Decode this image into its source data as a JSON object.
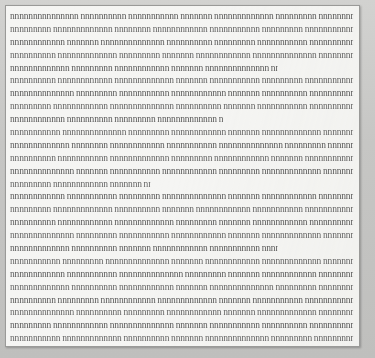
{
  "document": {
    "kind": "scanned-text-page",
    "page_background_color": "#f5f5f3",
    "page_border_color": "#9a9a98",
    "canvas_background_color": "#c9c9c7",
    "ink_color": "#3c3c3c",
    "legibility": "illegible",
    "line_count": 26,
    "line_pitch_px": 12.9,
    "char_pitch_px": 3.3,
    "alignment": "justified",
    "columns": 1,
    "lines": [
      {
        "id": 1,
        "ragged": "",
        "text": "nnnnnnnnnnnnnnn nnnnnnnnnn nnnnnnnnnnn nnnnnnn nnnnnnnnnnnnn nnnnnnnnn nnnnnnnnnnnn nnnnnnnnnnn nnnnnnn nnnnnnnnnnnnnn nnnnnnnnnn nnnnnnnnnnnn nnnnnnnn nnnnnnnnnnn nnnnnnnnnnnnnn nnnnnnnn"
      },
      {
        "id": 2,
        "ragged": "",
        "text": "nnnnnnnnn nnnnnnnnnnnnn nnnnnnnn nnnnnnnnnnnn nnnnnnnnnnn nnnnnnnnn nnnnnnnnnnnnnn nnnnnnn nnnnnnnnnnn nnnnnnnnnnnn nnnnnnnnn nnnnnnnnnnnnn nnnnnnnnnn nnnnnnn nnnnnnnnnnnnnn nnnnnnnnnn"
      },
      {
        "id": 3,
        "ragged": "",
        "text": "nnnnnnnnnnnn nnnnnnn nnnnnnnnnnnnnn nnnnnnnnnn nnnnnnnnn nnnnnnnnnnn nnnnnnnnnnnnn nnnnnnnn nnnnnnnnnnnn nnnnnnnnn nnnnnnnnnnnnnn nnnnnnnnn nnnnnnnnnnn nnnnnnn nnnnnnnnnnnn"
      },
      {
        "id": 4,
        "ragged": "",
        "text": "nnnnnnnnnn nnnnnnnnnnnnn nnnnnnnnn nnnnnnn nnnnnnnnnnnn nnnnnnnnnnnnnn nnnnnnnnnn nnnnnnnnn nnnnnnnnnnn nnnnnnnnnnnn nnnnnnn nnnnnnnnnnnnn nnnnnnnnnn nnnnnnnnnnnn nnnnnnnnn"
      },
      {
        "id": 5,
        "ragged": "short2",
        "text": "nnnnnnnnnnnnn nnnnnnnnn nnnnnnnnnnnn nnnnnnn nnnnnnnnnnnnnn nnnnnnnnnn nnnnnnnnnnn nnnnnnnnn nnnnnnnnnnnn nnnnnnnnnnnn nnnnnn"
      },
      {
        "id": 6,
        "ragged": "",
        "text": "nnnnnnnnnn nnnnnnnnnnnn nnnnnnnnnnnnn nnnnnnn nnnnnnnnnnn nnnnnnnnn nnnnnnnnnnnnnn nnnnnnnnnn nnnnnnnnnnnn nnnnnnnnn nnnnnnn nnnnnnnnnnnnn nnnnnnnnnnn nnnnnnnnnn nnnnnnnnnnnn"
      },
      {
        "id": 7,
        "ragged": "",
        "text": "nnnnnnnnnnnnnn nnnnnnnnn nnnnnnnnnnn nnnnnnnnnnnn nnnnnnn nnnnnnnnnn nnnnnnnnnnnnn nnnnnnnnn nnnnnnnnnnnn nnnnnnnnnnn nnnnnnnnnn nnnnnnn nnnnnnnnnnnnnn nnnnnnnnn nnnnnnnnnnn"
      },
      {
        "id": 8,
        "ragged": "",
        "text": "nnnnnnnnn nnnnnnnnnnnn nnnnnnnnnnnnnn nnnnnnnnnn nnnnnnn nnnnnnnnnnn nnnnnnnnnnnn nnnnnnnnn nnnnnnnnnnnnn nnnnnnnn nnnnnnnnnnnn nnnnnnnnnnn nnnnnnnnnn nnnnnnnnnnnnnn nnnnnnn"
      },
      {
        "id": 9,
        "ragged": "short",
        "text": "nnnnnnnnnnnn nnnnnnnnnn nnnnnnnnn nnnnnnnnnnnnn nnnnnnn nnnnnnnnnnnn nnnnnnnnnnn nnnnnnnn nnnnnnnnn"
      },
      {
        "id": 10,
        "ragged": "",
        "text": "nnnnnnnnnnn nnnnnnnnnnnnnn nnnnnnnnn nnnnnnnnnnnn nnnnnnn nnnnnnnnnnnnn nnnnnnnnnn nnnnnnnnnnnn nnnnnnnnn nnnnnnnnnnn nnnnnnnnnnnnnn nnnnnnn nnnnnnnnnn nnnnnnnnnnnn nnnnnnnnn"
      },
      {
        "id": 11,
        "ragged": "",
        "text": "nnnnnnnnnnnnn nnnnnnnn nnnnnnnnnnnn nnnnnnnnnnn nnnnnnnnnnnnnn nnnnnnnnn nnnnnnn nnnnnnnnnnnn nnnnnnnnnn nnnnnnnnnnnnn nnnnnnnnn nnnnnnnnnnn nnnnnnnnnnnn nnnnnnn nnnnnnnnnnnnnn"
      },
      {
        "id": 12,
        "ragged": "",
        "text": "nnnnnnnnnn nnnnnnnnnnn nnnnnnnnnnnnn nnnnnnnnn nnnnnnnnnnnn nnnnnnn nnnnnnnnnnnnnn nnnnnnnnnn nnnnnnnnn nnnnnnnnnnnn nnnnnnnnnnn nnnnnnnnnnnnn nnnnnnnn nnnnnnnnnnnn nnnnnnnnnn"
      },
      {
        "id": 13,
        "ragged": "",
        "text": "nnnnnnnnnnnnnn nnnnnnn nnnnnnnnnnn nnnnnnnnnnnn nnnnnnnnn nnnnnnnnnnnnn nnnnnnnnnn nnnnnnnnnnnn nnnnnnn nnnnnnnnnnnnnn nnnnnnnnn nnnnnnnnnnn nnnnnnnnnn nnnnnnnnnnnn nnnnnnnnnnnnn"
      },
      {
        "id": 14,
        "ragged": "short3",
        "text": "nnnnnnnnn nnnnnnnnnnnn nnnnnnn nnnnnnnnnnnnnn nnnnnnnnnn nnnnnnnnn"
      },
      {
        "id": 15,
        "ragged": "",
        "text": "nnnnnnnnnnnn nnnnnnnnnnn nnnnnnnnn nnnnnnnnnnnnnn nnnnnnn nnnnnnnnnnnn nnnnnnnnnnnnn nnnnnnnnnn nnnnnnnnn nnnnnnnnnnn nnnnnnnnnnnn nnnnnnn nnnnnnnnnnnnnn nnnnnnnnnn nnnnnnnnnnnn"
      },
      {
        "id": 16,
        "ragged": "",
        "text": "nnnnnnnnn nnnnnnnnnnnnn nnnnnnnnnn nnnnnnn nnnnnnnnnnnn nnnnnnnnnnn nnnnnnnnnnnnnn nnnnnnnnn nnnnnnnnnnnn nnnnnnnnnn nnnnnnn nnnnnnnnnnnnn nnnnnnnnnnn nnnnnnnnn nnnnnnnnnnnnnn"
      },
      {
        "id": 17,
        "ragged": "",
        "text": "nnnnnnnnnn nnnnnnnnnnnn nnnnnnnnnnnnn nnnnnnnnn nnnnnnn nnnnnnnnnnnn nnnnnnnnnnn nnnnnnnnnnnnnn nnnnnnnnnn nnnnnnnnn nnnnnnnnnnnn nnnnnnn nnnnnnnnnnnnn nnnnnnnnnn nnnnnnnnnnnn"
      },
      {
        "id": 18,
        "ragged": "",
        "text": "nnnnnnnnnnnnnn nnnnnnnnn nnnnnnnnnnn nnnnnnnnnnnn nnnnnnn nnnnnnnnnnnnn nnnnnnnnnn nnnnnnnnn nnnnnnnnnnnn nnnnnnnnnnnnnn nnnnnnn nnnnnnnnnnn nnnnnnnnnn nnnnnnnnnnnn nnnnnnnnn"
      },
      {
        "id": 19,
        "ragged": "short2",
        "text": "nnnnnnnnnnnnn nnnnnnnnnn nnnnnnn nnnnnnnnnnnn nnnnnnnnnnn nnnnnnnnnnnnnn nnnnnnnnn nnnnnnnnnnnn nnnnnnnnnn nnnnnn"
      },
      {
        "id": 20,
        "ragged": "",
        "text": "nnnnnnnnnnn nnnnnnnnn nnnnnnnnnnnnnn nnnnnnn nnnnnnnnnnnn nnnnnnnnnnnnn nnnnnnnnnn nnnnnnnnn nnnnnnnnnnnn nnnnnnnnnnn nnnnnnn nnnnnnnnnnnnnn nnnnnnnnnn nnnnnnnnnnnnn nnnnnnnnn"
      },
      {
        "id": 21,
        "ragged": "",
        "text": "nnnnnnnnnnnn nnnnnnnnnnn nnnnnnnnnnnnnn nnnnnnnnn nnnnnnn nnnnnnnnnnnn nnnnnnnnnn nnnnnnnnnnnnn nnnnnnnnn nnnnnnnnnnn nnnnnnnnnnnn nnnnnnn nnnnnnnnnnnnnn nnnnnnnnnn nnnnnnnnn"
      },
      {
        "id": 22,
        "ragged": "",
        "text": "nnnnnnnnnnnnn nnnnnnnnnn nnnnnnnnnnnn nnnnnnn nnnnnnnnnnnnnn nnnnnnnnn nnnnnnnnnnn nnnnnnnnnnnn nnnnnnnnnn nnnnnnn nnnnnnnnnnnnn nnnnnnnnn nnnnnnnnnnnn nnnnnnnnnnn nnnnnnnnnnnnnn"
      },
      {
        "id": 23,
        "ragged": "",
        "text": "nnnnnnnnnn nnnnnnnnn nnnnnnnnnnnn nnnnnnnnnnnnn nnnnnnn nnnnnnnnnnn nnnnnnnnnnnnnn nnnnnnnnnn nnnnnnnnn nnnnnnnnnnnn nnnnnnn nnnnnnnnnnnnn nnnnnnnnnn nnnnnnnnnnn nnnnnnnnnnnnn"
      },
      {
        "id": 24,
        "ragged": "",
        "text": "nnnnnnnnnnnnnn nnnnnnnnnn nnnnnnnnn nnnnnnnnnnnn nnnnnnn nnnnnnnnnnnnn nnnnnnnnnnn nnnnnnnnnn nnnnnnnnnnnnnn nnnnnnnnn nnnnnnn nnnnnnnnnnnn nnnnnnnnnnn nnnnnnnnnnnnn nnnnnnnnnn"
      },
      {
        "id": 25,
        "ragged": "",
        "text": "nnnnnnnnn nnnnnnnnnnnn nnnnnnnnnnnnnn nnnnnnn nnnnnnnnnnn nnnnnnnnnn nnnnnnnnnnnnn nnnnnnnnn nnnnnnnnnnnn nnnnnnnnnnn nnnnnnn nnnnnnnnnnnnnn nnnnnnnnnn nnnnnnnnn nnnnnnnnnnnn"
      },
      {
        "id": 26,
        "ragged": "",
        "text": "nnnnnnnnnnn nnnnnnnnnnnnn nnnnnnnnnn nnnnnnn nnnnnnnnnnnnnn nnnnnnnnn nnnnnnnnnnnn nnnnnnnnnnn nnnnnnnnnn nnnnnnnnnnnnn nnnnnnn nnnnnnnnn nnnnnnnnnnnn nnnnnnnnnnnnnn nnnnnnnnnn"
      }
    ]
  }
}
